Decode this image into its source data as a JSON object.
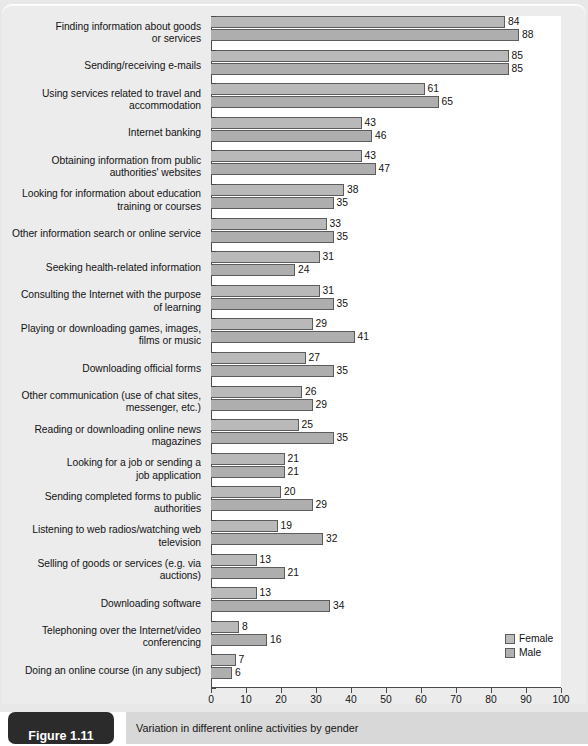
{
  "figure": {
    "badge_label": "Figure 1.11",
    "caption": "Variation in different online activities by gender"
  },
  "legend": {
    "position": "bottom-right",
    "items": [
      {
        "label": "Female",
        "color": "#bcbcbc"
      },
      {
        "label": "Male",
        "color": "#b0b0b0"
      }
    ]
  },
  "chart_data": {
    "type": "bar",
    "orientation": "horizontal",
    "title": "Variation in different online activities by gender",
    "xlabel": "",
    "ylabel": "",
    "xlim": [
      0,
      100
    ],
    "xticks": [
      0,
      10,
      20,
      30,
      40,
      50,
      60,
      70,
      80,
      90,
      100
    ],
    "grid": false,
    "legend_position": "bottom-right",
    "categories": [
      "Finding information about goods or services",
      "Sending/receiving e-mails",
      "Using services related to travel and accommodation",
      "Internet banking",
      "Obtaining information from public authorities' websites",
      "Looking for information about education training or courses",
      "Other information search or online service",
      "Seeking health-related information",
      "Consulting the Internet with the purpose of learning",
      "Playing or downloading games, images, films or music",
      "Downloading official forms",
      "Other communication (use of chat sites, messenger, etc.)",
      "Reading or downloading online news magazines",
      "Looking for a job or sending a job application",
      "Sending completed forms to public authorities",
      "Listening to web radios/watching web television",
      "Selling of goods or services (e.g. via auctions)",
      "Downloading software",
      "Telephoning over the Internet/video conferencing",
      "Doing an online course (in any subject)"
    ],
    "category_lines": [
      [
        "Finding information about goods",
        "or services"
      ],
      [
        "Sending/receiving e-mails"
      ],
      [
        "Using services related to travel and",
        "accommodation"
      ],
      [
        "Internet banking"
      ],
      [
        "Obtaining information from public",
        "authorities' websites"
      ],
      [
        "Looking for information about education",
        "training or courses"
      ],
      [
        "Other information search or online service"
      ],
      [
        "Seeking health-related information"
      ],
      [
        "Consulting the Internet with the purpose",
        "of learning"
      ],
      [
        "Playing or downloading games, images,",
        "films or music"
      ],
      [
        "Downloading official forms"
      ],
      [
        "Other communication (use of chat sites,",
        "messenger, etc.)"
      ],
      [
        "Reading or downloading online news",
        "magazines"
      ],
      [
        "Looking for a job or sending a",
        "job application"
      ],
      [
        "Sending completed forms to public",
        "authorities"
      ],
      [
        "Listening to web radios/watching web",
        "television"
      ],
      [
        "Selling of goods or services (e.g. via",
        "auctions)"
      ],
      [
        "Downloading software"
      ],
      [
        "Telephoning over the Internet/video",
        "conferencing"
      ],
      [
        "Doing an online course (in any subject)"
      ]
    ],
    "series": [
      {
        "name": "Female",
        "values": [
          84,
          85,
          61,
          43,
          43,
          38,
          33,
          31,
          31,
          29,
          27,
          26,
          25,
          21,
          20,
          19,
          13,
          13,
          8,
          7
        ]
      },
      {
        "name": "Male",
        "values": [
          88,
          85,
          65,
          46,
          47,
          35,
          35,
          24,
          35,
          41,
          35,
          29,
          35,
          21,
          29,
          32,
          21,
          34,
          16,
          6
        ]
      }
    ]
  }
}
